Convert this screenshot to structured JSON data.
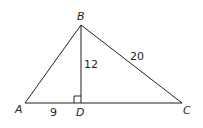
{
  "diagram": {
    "type": "right-triangle-altitude",
    "points": {
      "A": {
        "label": "A",
        "x": 25,
        "y": 103
      },
      "B": {
        "label": "B",
        "x": 81,
        "y": 25
      },
      "C": {
        "label": "C",
        "x": 182,
        "y": 103
      },
      "D": {
        "label": "D",
        "x": 81,
        "y": 103
      }
    },
    "measures": {
      "BD": "12",
      "BC": "20",
      "AD": "9"
    },
    "right_angle_at": "D",
    "colors": {
      "stroke": "#231f20",
      "background": "#ffffff"
    }
  }
}
